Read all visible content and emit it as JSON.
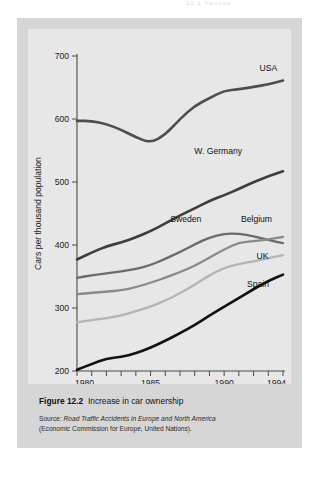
{
  "running_head": "12.2  Various",
  "figure": {
    "caption_label": "Figure",
    "caption_number": "12.2",
    "caption_text": "Increase in car ownership",
    "source_label": "Source:",
    "source_title": "Road Traffic Accidents in Europe and North America",
    "source_org": "(Economic Commission for Europe, United Nations)."
  },
  "colors": {
    "panel": "#d6d6d6",
    "plot": "#e7e7e7",
    "axis": "#4a4a4a",
    "usa": "#4d4d4d",
    "w_germany": "#3d3d3d",
    "sweden": "#6b6b6b",
    "belgium": "#8a8a8a",
    "uk": "#b4b4b4",
    "spain": "#111111"
  },
  "chart_data": {
    "type": "line",
    "title": "Increase in car ownership",
    "xlabel": "",
    "ylabel": "Cars per thousand population",
    "xlim": [
      1980,
      1994
    ],
    "ylim": [
      200,
      700
    ],
    "yticks": [
      200,
      300,
      400,
      500,
      600,
      700
    ],
    "ytick_labels": [
      "200",
      "300",
      "400",
      "500",
      "600",
      "700"
    ],
    "xticks": [
      1980,
      1981,
      1982,
      1983,
      1984,
      1985,
      1986,
      1987,
      1988,
      1989,
      1990,
      1991,
      1992,
      1993,
      1994
    ],
    "xtick_labels_shown": [
      "1980",
      "1985",
      "1990",
      "1994"
    ],
    "grid": false,
    "legend": "inline-labels-right",
    "x": [
      1980,
      1981,
      1982,
      1983,
      1984,
      1985,
      1986,
      1987,
      1988,
      1989,
      1990,
      1991,
      1992,
      1993,
      1994
    ],
    "series": [
      {
        "name": "USA",
        "color": "#4d4d4d",
        "label_x": 1993.0,
        "label_y": 676,
        "values": [
          597,
          597,
          592,
          583,
          571,
          562,
          575,
          600,
          621,
          633,
          645,
          647,
          651,
          655,
          661
        ]
      },
      {
        "name": "W. Germany",
        "color": "#3d3d3d",
        "label_x": 1989.6,
        "label_y": 545,
        "values": [
          377,
          388,
          398,
          404,
          412,
          422,
          434,
          447,
          458,
          470,
          479,
          489,
          500,
          509,
          517
        ]
      },
      {
        "name": "Sweden",
        "color": "#6b6b6b",
        "label_x": 1987.4,
        "label_y": 437,
        "values": [
          348,
          352,
          355,
          358,
          362,
          368,
          378,
          389,
          401,
          412,
          418,
          418,
          414,
          408,
          403
        ]
      },
      {
        "name": "Belgium",
        "color": "#8a8a8a",
        "label_x": 1992.2,
        "label_y": 436,
        "values": [
          322,
          324,
          326,
          328,
          333,
          340,
          348,
          357,
          367,
          380,
          393,
          404,
          406,
          409,
          413
        ]
      },
      {
        "name": "UK",
        "color": "#b4b4b4",
        "label_x": 1992.6,
        "label_y": 378,
        "values": [
          277,
          281,
          284,
          288,
          295,
          302,
          312,
          323,
          337,
          352,
          364,
          370,
          374,
          379,
          384
        ]
      },
      {
        "name": "Spain",
        "color": "#111111",
        "label_x": 1992.3,
        "label_y": 333,
        "values": [
          202,
          211,
          220,
          222,
          228,
          237,
          248,
          260,
          273,
          288,
          302,
          316,
          330,
          343,
          353
        ]
      }
    ]
  }
}
